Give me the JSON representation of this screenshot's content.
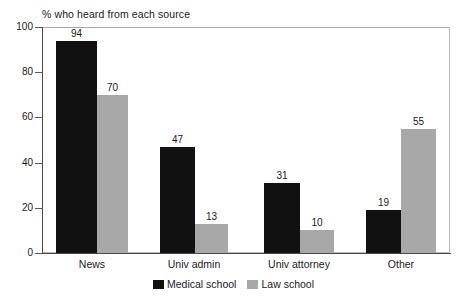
{
  "chart_data": {
    "type": "bar",
    "title": "% who heard from each source",
    "xlabel": "",
    "ylabel": "",
    "ylim": [
      0,
      100
    ],
    "yticks": [
      0,
      20,
      40,
      60,
      80,
      100
    ],
    "grid": false,
    "legend_position": "bottom-center",
    "categories": [
      "News",
      "Univ admin",
      "Univ attorney",
      "Other"
    ],
    "series": [
      {
        "name": "Medical school",
        "color": "#111111",
        "values": [
          94,
          47,
          31,
          19
        ]
      },
      {
        "name": "Law school",
        "color": "#a8a8a8",
        "values": [
          70,
          13,
          10,
          55
        ]
      }
    ]
  },
  "axis": {
    "y_tick_labels": [
      "100",
      "80",
      "60",
      "40",
      "20",
      "0"
    ]
  },
  "legend": {
    "items": [
      {
        "label": "Medical school",
        "swatch": "medical-swatch"
      },
      {
        "label": "Law school",
        "swatch": "law-swatch"
      }
    ]
  }
}
